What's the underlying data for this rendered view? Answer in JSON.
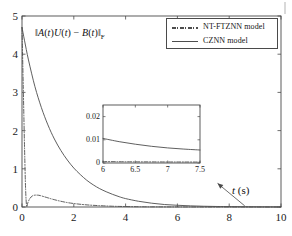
{
  "figure": {
    "background_color": "#ffffff",
    "axis_color": "#4a4a4a",
    "curve_color": "#4d4d4d"
  },
  "xlabel_html": "<i>t</i> (s)",
  "ylabel_html": "&#8214;<i>A</i>(<i>t</i>)<i>U</i>(<i>t</i>) &#8722; <i>B</i>(<i>t</i>)&#8214;<sub>F</sub>",
  "legend": {
    "entries": [
      {
        "label": "NT-FTZNN model",
        "style": "dashdot",
        "color": "#4d4d4d"
      },
      {
        "label": "CZNN model",
        "style": "solid",
        "color": "#4d4d4d"
      }
    ]
  },
  "main_ticks": {
    "x": [
      "0",
      "2",
      "4",
      "6",
      "8",
      "10"
    ],
    "y": [
      "0",
      "1",
      "2",
      "3",
      "4",
      "5"
    ]
  },
  "inset_ticks": {
    "x": [
      "6",
      "6.5",
      "7",
      "7.5"
    ],
    "y": [
      "0",
      "0.01",
      "0.02"
    ]
  },
  "chart_data": {
    "type": "line",
    "title": "",
    "xlabel": "t (s)",
    "ylabel": "||A(t)U(t) - B(t)||_F",
    "xlim": [
      0,
      10
    ],
    "ylim": [
      0,
      5
    ],
    "xticks": [
      0,
      2,
      4,
      6,
      8,
      10
    ],
    "yticks": [
      0,
      1,
      2,
      3,
      4,
      5
    ],
    "grid": false,
    "legend_position": "top-right",
    "series": [
      {
        "name": "NT-FTZNN model",
        "style": "dashdot",
        "color": "#4d4d4d",
        "x": [
          0,
          0.05,
          0.1,
          0.14,
          0.18,
          0.22,
          0.3,
          0.4,
          0.5,
          0.6,
          0.7,
          0.85,
          1.0,
          1.2,
          1.5,
          1.8,
          2.2,
          2.6,
          3.0,
          3.5,
          4.0,
          4.5,
          5.0,
          6.0,
          7.0,
          8.0,
          9.0,
          10.0
        ],
        "y": [
          4.7,
          3.1,
          1.5,
          0.45,
          0.02,
          0.1,
          0.22,
          0.29,
          0.31,
          0.31,
          0.3,
          0.27,
          0.24,
          0.2,
          0.15,
          0.11,
          0.075,
          0.05,
          0.035,
          0.02,
          0.012,
          0.007,
          0.004,
          0.0015,
          0.0008,
          0.0005,
          0.0004,
          0.0003
        ]
      },
      {
        "name": "CZNN model",
        "style": "solid",
        "color": "#4d4d4d",
        "x": [
          0,
          0.1,
          0.25,
          0.5,
          0.75,
          1.0,
          1.25,
          1.5,
          1.75,
          2.0,
          2.25,
          2.5,
          2.75,
          3.0,
          3.25,
          3.5,
          3.75,
          4.0,
          4.5,
          5.0,
          5.5,
          6.0,
          6.5,
          7.0,
          7.5,
          8.0,
          9.0,
          10.0
        ],
        "y": [
          4.7,
          4.35,
          3.85,
          3.15,
          2.6,
          2.15,
          1.78,
          1.48,
          1.23,
          1.02,
          0.85,
          0.7,
          0.58,
          0.48,
          0.4,
          0.33,
          0.27,
          0.22,
          0.15,
          0.1,
          0.065,
          0.045,
          0.03,
          0.02,
          0.014,
          0.01,
          0.005,
          0.002
        ]
      }
    ],
    "inset": {
      "type": "line",
      "xlim": [
        6,
        7.5
      ],
      "ylim": [
        0,
        0.025
      ],
      "xticks": [
        6,
        6.5,
        7,
        7.5
      ],
      "yticks": [
        0,
        0.01,
        0.02
      ],
      "grid": false,
      "series": [
        {
          "name": "NT-FTZNN model",
          "style": "dashdot",
          "color": "#4d4d4d",
          "x": [
            6,
            6.25,
            6.5,
            6.75,
            7,
            7.25,
            7.5
          ],
          "y": [
            0.0006,
            0.00055,
            0.0005,
            0.00048,
            0.00045,
            0.00043,
            0.0004
          ]
        },
        {
          "name": "CZNN model",
          "style": "solid",
          "color": "#4d4d4d",
          "x": [
            6,
            6.25,
            6.5,
            6.75,
            7,
            7.25,
            7.5
          ],
          "y": [
            0.0106,
            0.0092,
            0.0081,
            0.0072,
            0.0065,
            0.006,
            0.0056
          ]
        }
      ]
    },
    "annotation": {
      "type": "arrow",
      "text": "",
      "from_xy": [
        8.6,
        0.03
      ],
      "to_xy": [
        7.55,
        0.62
      ]
    }
  }
}
